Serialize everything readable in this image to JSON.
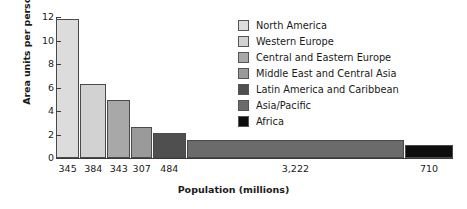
{
  "chart_data": {
    "type": "bar",
    "title": "",
    "xlabel": "Population (millions)",
    "ylabel": "Area units per person",
    "ylim": [
      0,
      12
    ],
    "yticks": [
      0,
      2,
      4,
      6,
      8,
      10,
      12
    ],
    "grid": false,
    "legend_position": "right",
    "note": "Variable-width bar chart (Marimekko style): bar width is proportional to population, bar height is area units per person.",
    "categories": [
      "North America",
      "Western Europe",
      "Central and Eastern Europe",
      "Middle East and Central Asia",
      "Latin America and Caribbean",
      "Asia/Pacific",
      "Africa"
    ],
    "values": [
      11.8,
      6.3,
      4.9,
      2.6,
      2.1,
      1.55,
      1.1
    ],
    "widths": [
      345,
      384,
      343,
      307,
      484,
      3222,
      710
    ],
    "tick_labels": [
      "345",
      "384",
      "343",
      "307",
      "484",
      "3,222",
      "710"
    ],
    "colors": [
      "#dcdcdc",
      "#d2d2d2",
      "#a8a8a8",
      "#9a9a9a",
      "#4f4f4f",
      "#6b6b6b",
      "#0d0d0d"
    ]
  },
  "legend": {
    "items": [
      {
        "label": "North America",
        "color": "#dcdcdc"
      },
      {
        "label": "Western Europe",
        "color": "#d2d2d2"
      },
      {
        "label": "Central and Eastern Europe",
        "color": "#a8a8a8"
      },
      {
        "label": "Middle East and Central Asia",
        "color": "#9a9a9a"
      },
      {
        "label": "Latin America and Caribbean",
        "color": "#4f4f4f"
      },
      {
        "label": "Asia/Pacific",
        "color": "#6b6b6b"
      },
      {
        "label": "Africa",
        "color": "#0d0d0d"
      }
    ]
  }
}
